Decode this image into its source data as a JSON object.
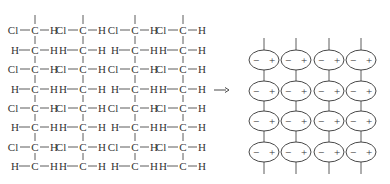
{
  "figure": {
    "left_panel": {
      "chain_count": 4,
      "chain_x": [
        35,
        83,
        135,
        183
      ],
      "row_y": [
        30,
        50,
        69,
        89,
        108,
        127,
        147,
        166
      ],
      "rows": [
        {
          "left": "Cl",
          "center": "C",
          "right": "H"
        },
        {
          "left": "H",
          "center": "C",
          "right": "H"
        },
        {
          "left": "Cl",
          "center": "C",
          "right": "H"
        },
        {
          "left": "H",
          "center": "C",
          "right": "H"
        },
        {
          "left": "Cl",
          "center": "C",
          "right": "H"
        },
        {
          "left": "H",
          "center": "C",
          "right": "H"
        },
        {
          "left": "Cl",
          "center": "C",
          "right": "H"
        },
        {
          "left": "H",
          "center": "C",
          "right": "H"
        }
      ]
    },
    "arrow": {
      "symbol": "→",
      "x1": 214,
      "x2": 229,
      "y": 90
    },
    "right_panel": {
      "columns_x": [
        264,
        296,
        329,
        361
      ],
      "rows_y": [
        60,
        91,
        121,
        152
      ],
      "ellipse_rx": 15,
      "ellipse_ry": 10,
      "negative_sign": "−",
      "positive_sign": "+"
    },
    "colors": {
      "ink": "#333333",
      "background": "#ffffff"
    }
  }
}
